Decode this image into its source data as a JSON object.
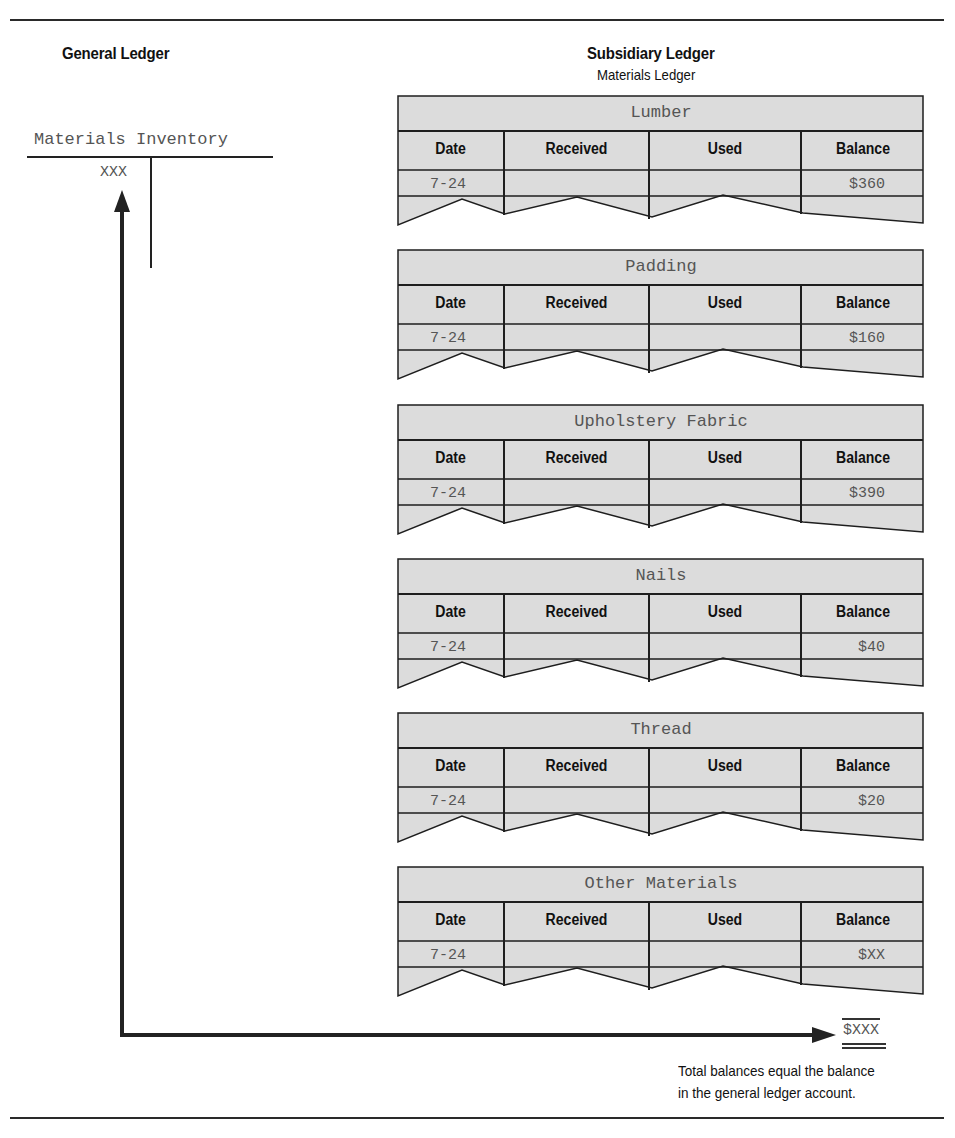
{
  "general_ledger": {
    "heading": "General Ledger",
    "account_title": "Materials Inventory",
    "debit_balance": "XXX"
  },
  "subsidiary_ledger": {
    "heading": "Subsidiary Ledger",
    "subheading": "Materials Ledger",
    "columns": [
      "Date",
      "Received",
      "Used",
      "Balance"
    ],
    "cards": [
      {
        "title": "Lumber",
        "date": "7-24",
        "received": "",
        "used": "",
        "balance": "$360"
      },
      {
        "title": "Padding",
        "date": "7-24",
        "received": "",
        "used": "",
        "balance": "$160"
      },
      {
        "title": "Upholstery Fabric",
        "date": "7-24",
        "received": "",
        "used": "",
        "balance": "$390"
      },
      {
        "title": "Nails",
        "date": "7-24",
        "received": "",
        "used": "",
        "balance": "$40"
      },
      {
        "title": "Thread",
        "date": "7-24",
        "received": "",
        "used": "",
        "balance": "$20"
      },
      {
        "title": "Other Materials",
        "date": "7-24",
        "received": "",
        "used": "",
        "balance": "$XX"
      }
    ]
  },
  "total": {
    "value": "$XXX",
    "note_line1": "Total balances equal the balance",
    "note_line2": "in the general ledger account."
  },
  "colors": {
    "card_fill": "#dcdcdc",
    "line": "#1e1e1e",
    "mono_text": "#555555"
  }
}
